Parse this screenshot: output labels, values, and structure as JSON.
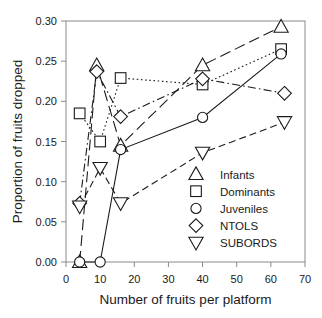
{
  "chart_data": {
    "type": "line",
    "title": "",
    "xlabel": "Number of fruits per platform",
    "ylabel": "Proportion of fruits dropped",
    "xlim": [
      0,
      70
    ],
    "ylim": [
      0.0,
      0.3
    ],
    "xticks": [
      0,
      10,
      20,
      30,
      40,
      50,
      60,
      70
    ],
    "xticklabels": [
      "0",
      "10",
      "20",
      "30",
      "40",
      "50",
      "60",
      "70"
    ],
    "yticks": [
      0.0,
      0.05,
      0.1,
      0.15,
      0.2,
      0.25,
      0.3
    ],
    "yticklabels": [
      "0.00",
      "0.05",
      "0.10",
      "0.15",
      "0.20",
      "0.25",
      "0.30"
    ],
    "grid": false,
    "legend_position": "lower-right-inside",
    "series": [
      {
        "name": "Infants",
        "marker": "triangle-up",
        "linestyle": "long-dash",
        "x": [
          4,
          9,
          16,
          40,
          63
        ],
        "values": [
          0.0,
          0.245,
          0.145,
          0.245,
          0.293
        ]
      },
      {
        "name": "Dominants",
        "marker": "square",
        "linestyle": "dotted",
        "x": [
          4,
          10,
          16,
          40,
          63
        ],
        "values": [
          0.185,
          0.15,
          0.229,
          0.221,
          0.265
        ]
      },
      {
        "name": "Juveniles",
        "marker": "circle",
        "linestyle": "solid",
        "x": [
          4,
          10,
          16,
          40,
          63
        ],
        "values": [
          0.0,
          0.0,
          0.14,
          0.18,
          0.259
        ]
      },
      {
        "name": "NTOLS",
        "marker": "diamond",
        "linestyle": "dash-dot",
        "x": [
          4,
          9,
          16,
          40,
          64
        ],
        "values": [
          0.073,
          0.237,
          0.181,
          0.228,
          0.21
        ]
      },
      {
        "name": "SUBORDS",
        "marker": "triangle-down",
        "linestyle": "dash",
        "x": [
          4,
          10,
          16,
          40,
          64
        ],
        "values": [
          0.069,
          0.117,
          0.073,
          0.136,
          0.174
        ]
      }
    ]
  },
  "colors": {
    "ink": "#1a1a1a",
    "frame": "#8a8a8a",
    "background": "#ffffff"
  }
}
